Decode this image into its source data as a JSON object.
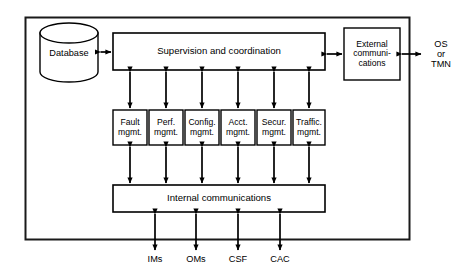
{
  "diagram": {
    "outer_frame": {
      "name": "system-boundary"
    },
    "database": {
      "label": "Database",
      "shape": "cylinder"
    },
    "supervision": {
      "label": "Supervision and coordination"
    },
    "external_comms": {
      "label": "External\ncommuni-\ncations"
    },
    "external_endpoint": {
      "label": "OS\nor\nTMN"
    },
    "internal_comms": {
      "label": "Internal communications"
    },
    "management_blocks": [
      {
        "line1": "Fault",
        "line2": "mgmt."
      },
      {
        "line1": "Perf.",
        "line2": "mgmt."
      },
      {
        "line1": "Config.",
        "line2": "mgmt."
      },
      {
        "line1": "Acct.",
        "line2": "mgmt."
      },
      {
        "line1": "Secur.",
        "line2": "mgmt."
      },
      {
        "line1": "Traffic.",
        "line2": "mgmt."
      }
    ],
    "bottom_interfaces": [
      {
        "label": "IMs"
      },
      {
        "label": "OMs"
      },
      {
        "label": "CSF"
      },
      {
        "label": "CAC"
      }
    ],
    "colors": {
      "stroke": "#000000",
      "background": "#ffffff",
      "frame": "#1a1a1a"
    }
  }
}
